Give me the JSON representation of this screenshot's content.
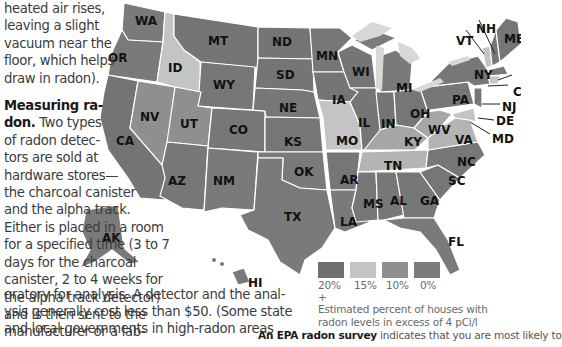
{
  "article": {
    "column_lines": [
      "heated air rises,",
      "leaving a slight",
      "vacuum near the",
      "floor, which helps",
      "draw in radon)."
    ],
    "section_heading_line1": "Measuring ra-",
    "section_heading_line2": "don.",
    "section_lines": [
      " Two types",
      "of radon detec-",
      "tors are sold at",
      "hardware stores—",
      "the charcoal canister",
      "and the alpha track.",
      "Either is placed in a room",
      "for a specified time (3 to 7",
      "days for the charcoal",
      "canister, 2 to 4 weeks for",
      "the alpha track detector)",
      "and is then sent to the",
      "manufacturer or a lab-"
    ],
    "wide_lines": [
      "oratory for analysis. A detector and the anal-",
      "ysis generally cost less than $50. (Some state",
      "and local governments in high-radon areas"
    ]
  },
  "map": {
    "colors": {
      "pct_20_plus": "#6f6f6f",
      "pct_15": "#c4c4c4",
      "pct_10": "#8f8f8f",
      "pct_0": "#7c7c7c",
      "water": "#d8d8d8",
      "border": "#ffffff"
    },
    "state_labels": {
      "WA": "WA",
      "OR": "OR",
      "CA": "CA",
      "ID": "ID",
      "NV": "NV",
      "MT": "MT",
      "WY": "WY",
      "UT": "UT",
      "AZ": "AZ",
      "CO": "CO",
      "NM": "NM",
      "ND": "ND",
      "SD": "SD",
      "NE": "NE",
      "KS": "KS",
      "OK": "OK",
      "TX": "TX",
      "MN": "MN",
      "IA": "IA",
      "MO": "MO",
      "AR": "AR",
      "LA": "LA",
      "WI": "WI",
      "IL": "IL",
      "MI": "MI",
      "IN": "IN",
      "OH": "OH",
      "KY": "KY",
      "TN": "TN",
      "MS": "MS",
      "AL": "AL",
      "GA": "GA",
      "FL": "FL",
      "SC": "SC",
      "NC": "NC",
      "VA": "VA",
      "WV": "WV",
      "PA": "PA",
      "NY": "NY",
      "VT": "VT",
      "NH": "NH",
      "ME": "ME",
      "NJ": "NJ",
      "DE": "DE",
      "MD": "MD",
      "CT": "C",
      "AK": "AK",
      "HI": "HI"
    }
  },
  "legend": {
    "items": [
      {
        "label": "20% +",
        "color": "#6f6f6f"
      },
      {
        "label": "15%",
        "color": "#c4c4c4"
      },
      {
        "label": "10%",
        "color": "#8f8f8f"
      },
      {
        "label": "0%",
        "color": "#7c7c7c"
      }
    ],
    "caption_line1": "Estimated percent of houses with",
    "caption_line2": "radon levels in excess of 4 pCi/l"
  },
  "survey": {
    "bold": "An EPA radon survey",
    "rest": " indicates that you are most likely to"
  }
}
